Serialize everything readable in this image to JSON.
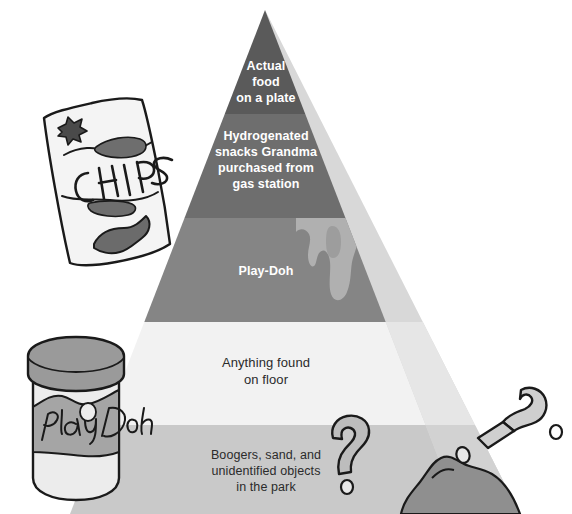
{
  "pyramid": {
    "tiers": [
      {
        "id": "tier-1",
        "rank": 1,
        "label": "Actual\nfood\non a plate",
        "color": "#5a5a5a",
        "text_color": "#ffffff"
      },
      {
        "id": "tier-2",
        "rank": 2,
        "label": "Hydrogenated\nsnacks Grandma\npurchased from\ngas station",
        "color": "#6e6e6e",
        "text_color": "#ffffff"
      },
      {
        "id": "tier-3",
        "rank": 3,
        "label": "Play-Doh",
        "color": "#858585",
        "text_color": "#ffffff"
      },
      {
        "id": "tier-4",
        "rank": 4,
        "label": "Anything found\non floor",
        "color": "#f2f2f2",
        "text_color": "#2b2b2b"
      },
      {
        "id": "tier-5",
        "rank": 5,
        "label": "Boogers, sand, and\nunidentified objects\nin the park",
        "color": "#c9c9c9",
        "text_color": "#2b2b2b"
      }
    ],
    "shadow_color": "#d4d4d4",
    "shadow_color_dark": "#bdbdbd"
  },
  "illustrations": [
    {
      "id": "chips-bag",
      "name": "chips-bag-illustration",
      "caption": "CHIPS",
      "outline_color": "#1a1a1a",
      "fill_color": "#f0f0f0",
      "accent_color": "#8a8a8a"
    },
    {
      "id": "playdoh-jar",
      "name": "playdoh-jar-illustration",
      "caption": "Play Doh",
      "outline_color": "#1a1a1a",
      "fill_color": "#e8e8e8",
      "accent_color": "#9a9a9a"
    },
    {
      "id": "question-mark-upper",
      "name": "question-mark-upper",
      "caption": "?",
      "outline_color": "#1a1a1a",
      "fill_color": "#bdbdbd"
    },
    {
      "id": "question-mark-lower",
      "name": "question-mark-lower",
      "caption": "?",
      "outline_color": "#1a1a1a",
      "fill_color": "#cfcfcf"
    },
    {
      "id": "dirt-mound",
      "name": "dirt-mound-illustration",
      "outline_color": "#1a1a1a",
      "fill_color": "#8f8f8f"
    },
    {
      "id": "playdoh-drip",
      "name": "playdoh-drip-shape",
      "fill_color": "#b0b0b0"
    }
  ]
}
